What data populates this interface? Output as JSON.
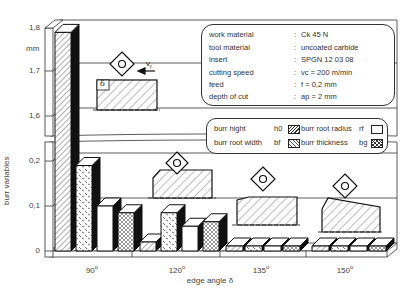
{
  "chart_data": {
    "type": "bar",
    "title": "",
    "xlabel": "edge angle δ",
    "ylabel": "burr variables",
    "yunit": "mm",
    "categories": [
      "90°",
      "120°",
      "135°",
      "150°"
    ],
    "series": [
      {
        "name": "burr hight",
        "symbol": "h0",
        "pattern": "hatch",
        "values": [
          1.79,
          0.02,
          0.005,
          0.005
        ]
      },
      {
        "name": "burr root width",
        "symbol": "bf",
        "pattern": "dashes",
        "values": [
          0.19,
          0.085,
          0.005,
          0.005
        ]
      },
      {
        "name": "burr root radius",
        "symbol": "rf",
        "pattern": "blank",
        "values": [
          0.1,
          0.055,
          0.005,
          0.005
        ]
      },
      {
        "name": "burr thickness",
        "symbol": "bg",
        "pattern": "crosshatch",
        "values": [
          0.085,
          0.065,
          0.005,
          0.005
        ]
      }
    ],
    "yaxis_break": true,
    "ylim_lower": [
      0,
      0.2
    ],
    "ylim_upper": [
      1.6,
      1.8
    ],
    "yticks_lower": [
      "0",
      "0,1",
      "0,2"
    ],
    "yticks_upper": [
      "1,6",
      "1,7",
      "1,8"
    ],
    "grid": true,
    "legend_position": "upper right",
    "style": "3d"
  },
  "axis": {
    "unit": "mm",
    "ylabel": "burr variables",
    "xlabel": "edge angle δ",
    "yticks": [
      {
        "label": "1,8",
        "y": 28
      },
      {
        "label": "1,7",
        "y": 71
      },
      {
        "label": "1,6",
        "y": 116
      },
      {
        "label": "0,2",
        "y": 161
      },
      {
        "label": "0,1",
        "y": 206
      },
      {
        "label": "0",
        "y": 251
      }
    ],
    "xticks": [
      {
        "label": "90",
        "deg": "o"
      },
      {
        "label": "120",
        "deg": "o"
      },
      {
        "label": "135",
        "deg": "o"
      },
      {
        "label": "150",
        "deg": "o"
      }
    ]
  },
  "conditions": {
    "rows": [
      {
        "key": "work material",
        "value": "Ck 45 N"
      },
      {
        "key": "tool material",
        "value": "uncoated carbide"
      },
      {
        "key": "insert",
        "value": "SPGN 12 03 08"
      },
      {
        "key": "cutting speed",
        "value": "vc = 200 m/min"
      },
      {
        "key": "feed",
        "value": "f   = 0,2 mm"
      },
      {
        "key": "depth of cut",
        "value": "ap = 2 mm"
      }
    ]
  },
  "legend": {
    "items": [
      {
        "label": "burr hight",
        "symbol": "h0"
      },
      {
        "label": "burr root radius",
        "symbol": "rf"
      },
      {
        "label": "burr root width",
        "symbol": "bf"
      },
      {
        "label": "burr thickness",
        "symbol": "bg"
      }
    ]
  },
  "sketch": {
    "delta_label": "δ",
    "feed_label": "vf"
  },
  "colors": {
    "line": "#111111",
    "background": "#ffffff",
    "text": "#444444"
  }
}
